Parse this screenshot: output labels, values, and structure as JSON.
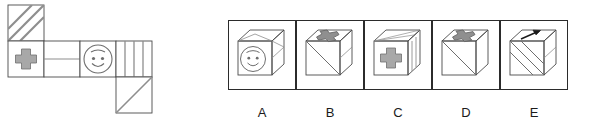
{
  "figure": {
    "type": "cube-net-folding-question",
    "net": {
      "name": "cube-net",
      "description": "Unfolded cube net of six squares",
      "cell_size": 36,
      "origin": {
        "x": 8,
        "y": 5
      },
      "cells": [
        {
          "id": "net-cell-diagonal-stripes",
          "col": 0,
          "row": 0,
          "pattern": "diagonal-stripes",
          "stripe_count": 3,
          "stripe_direction": "bottom-left-to-top-right"
        },
        {
          "id": "net-cell-cross",
          "col": 0,
          "row": 1,
          "pattern": "cross",
          "fill": "#a8a8a8"
        },
        {
          "id": "net-cell-blank-line",
          "col": 1,
          "row": 1,
          "pattern": "horizontal-line"
        },
        {
          "id": "net-cell-smiley",
          "col": 2,
          "row": 1,
          "pattern": "smiley-face"
        },
        {
          "id": "net-cell-vertical-stripes",
          "col": 3,
          "row": 1,
          "pattern": "vertical-stripes",
          "stripe_count": 3,
          "stripe_direction": "vertical"
        },
        {
          "id": "net-cell-single-diagonal",
          "col": 3,
          "row": 2,
          "pattern": "single-diagonal",
          "stripe_direction": "bottom-left-to-top-right"
        }
      ]
    },
    "options": {
      "name": "answer-options",
      "box": {
        "start_x": 228,
        "y": 20,
        "width": 68,
        "height": 70,
        "gap": 0
      },
      "items": [
        {
          "label": "A",
          "name": "option-a",
          "cube": {
            "front_face": "smiley-face",
            "top_face": "blank",
            "right_face": "blank"
          }
        },
        {
          "label": "B",
          "name": "option-b",
          "cube": {
            "front_face": "single-diagonal",
            "top_face": "cross",
            "right_face": "horizontal-line"
          }
        },
        {
          "label": "C",
          "name": "option-c",
          "cube": {
            "front_face": "cross",
            "top_face": "blank",
            "right_face": "vertical-stripes"
          }
        },
        {
          "label": "D",
          "name": "option-d",
          "cube": {
            "front_face": "single-diagonal",
            "top_face": "cross",
            "right_face": "blank"
          }
        },
        {
          "label": "E",
          "name": "option-e",
          "cube": {
            "front_face": "diagonal-stripes",
            "top_face": "arrow",
            "right_face": "blank"
          }
        }
      ]
    }
  },
  "colors": {
    "outline": "#2b2b2b",
    "light_outline": "#6e6e6e",
    "shape_fill": "#a8a8a8",
    "shape_stroke": "#6e6e6e",
    "label": "#1b1b1b",
    "background": "#ffffff"
  }
}
